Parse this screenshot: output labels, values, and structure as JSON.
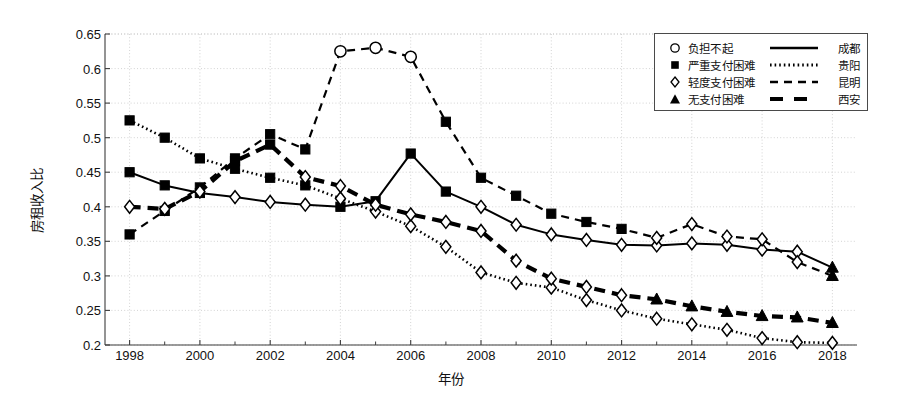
{
  "chart_data": {
    "type": "line",
    "title": "",
    "xlabel": "年份",
    "ylabel": "房租收入比",
    "xlim": [
      1997.3,
      2018.7
    ],
    "ylim": [
      0.2,
      0.65
    ],
    "grid": true,
    "y_ticks": [
      "0.2",
      "0.25",
      "0.3",
      "0.35",
      "0.4",
      "0.45",
      "0.5",
      "0.55",
      "0.6",
      "0.65"
    ],
    "y_tick_values": [
      0.2,
      0.25,
      0.3,
      0.35,
      0.4,
      0.45,
      0.5,
      0.55,
      0.6,
      0.65
    ],
    "x_ticks": [
      "1998",
      "2000",
      "2002",
      "2004",
      "2006",
      "2008",
      "2010",
      "2012",
      "2014",
      "2016",
      "2018"
    ],
    "x_tick_values": [
      1998,
      2000,
      2002,
      2004,
      2006,
      2008,
      2010,
      2012,
      2014,
      2016,
      2018
    ],
    "x_minor_values": [
      1999,
      2001,
      2003,
      2005,
      2007,
      2009,
      2011,
      2013,
      2015,
      2017
    ],
    "x": [
      1998,
      1999,
      2000,
      2001,
      2002,
      2003,
      2004,
      2005,
      2006,
      2007,
      2008,
      2009,
      2010,
      2011,
      2012,
      2013,
      2014,
      2015,
      2016,
      2017,
      2018
    ],
    "legend_position": "top-right",
    "legend_marker_entries": [
      {
        "marker": "circle-open",
        "label": "负担不起"
      },
      {
        "marker": "square-filled",
        "label": "严重支付困难"
      },
      {
        "marker": "diamond-open",
        "label": "轻度支付困难"
      },
      {
        "marker": "triangle-filled",
        "label": "无支付困难"
      }
    ],
    "legend_line_entries": [
      {
        "style": "solid",
        "name": "成都"
      },
      {
        "style": "dotted",
        "name": "贵阳"
      },
      {
        "style": "dashed",
        "name": "昆明"
      },
      {
        "style": "thick-dash",
        "name": "西安"
      }
    ],
    "series": [
      {
        "name": "成都",
        "style": "solid",
        "values": [
          0.45,
          0.431,
          0.42,
          0.414,
          0.407,
          0.403,
          0.4,
          0.408,
          0.477,
          0.422,
          0.4,
          0.374,
          0.36,
          0.352,
          0.345,
          0.344,
          0.347,
          0.345,
          0.338,
          0.335,
          0.312
        ],
        "markers": [
          "square-filled",
          "square-filled",
          "square-filled",
          "diamond-open",
          "diamond-open",
          "diamond-open",
          "square-filled",
          "square-filled",
          "square-filled",
          "square-filled",
          "diamond-open",
          "diamond-open",
          "diamond-open",
          "diamond-open",
          "diamond-open",
          "diamond-open",
          "diamond-open",
          "diamond-open",
          "diamond-open",
          "diamond-open",
          "triangle-filled"
        ]
      },
      {
        "name": "贵阳",
        "style": "dotted",
        "values": [
          0.525,
          0.5,
          0.47,
          0.455,
          0.442,
          0.431,
          0.412,
          0.393,
          0.372,
          0.342,
          0.305,
          0.29,
          0.283,
          0.265,
          0.25,
          0.238,
          0.23,
          0.222,
          0.21,
          0.204,
          0.203
        ],
        "markers": [
          "square-filled",
          "square-filled",
          "square-filled",
          "square-filled",
          "square-filled",
          "square-filled",
          "diamond-open",
          "diamond-open",
          "diamond-open",
          "diamond-open",
          "diamond-open",
          "diamond-open",
          "diamond-open",
          "diamond-open",
          "diamond-open",
          "diamond-open",
          "diamond-open",
          "diamond-open",
          "diamond-open",
          "diamond-open",
          "diamond-open"
        ]
      },
      {
        "name": "昆明",
        "style": "dashed",
        "values": [
          0.36,
          0.394,
          0.428,
          0.47,
          0.505,
          0.483,
          0.625,
          0.63,
          0.617,
          0.523,
          0.442,
          0.416,
          0.39,
          0.378,
          0.368,
          0.355,
          0.375,
          0.357,
          0.353,
          0.32,
          0.3
        ],
        "markers": [
          "square-filled",
          "square-filled",
          "square-filled",
          "square-filled",
          "square-filled",
          "square-filled",
          "circle-open",
          "circle-open",
          "circle-open",
          "square-filled",
          "square-filled",
          "square-filled",
          "square-filled",
          "square-filled",
          "square-filled",
          "diamond-open",
          "diamond-open",
          "diamond-open",
          "diamond-open",
          "diamond-open",
          "triangle-filled"
        ]
      },
      {
        "name": "西安",
        "style": "thick-dash",
        "values": [
          0.4,
          0.397,
          0.422,
          0.466,
          0.49,
          0.443,
          0.43,
          0.403,
          0.389,
          0.378,
          0.365,
          0.322,
          0.296,
          0.284,
          0.272,
          0.266,
          0.256,
          0.248,
          0.242,
          0.24,
          0.232
        ],
        "markers": [
          "diamond-open",
          "diamond-open",
          "diamond-open",
          "square-filled",
          "square-filled",
          "diamond-open",
          "diamond-open",
          "diamond-open",
          "diamond-open",
          "diamond-open",
          "diamond-open",
          "diamond-open",
          "diamond-open",
          "diamond-open",
          "diamond-open",
          "triangle-filled",
          "triangle-filled",
          "triangle-filled",
          "triangle-filled",
          "triangle-filled",
          "triangle-filled"
        ]
      }
    ]
  },
  "colors": {
    "line": "#000000",
    "axis": "#3c3c3c",
    "grid": "#c8c8c8",
    "background": "#ffffff"
  }
}
